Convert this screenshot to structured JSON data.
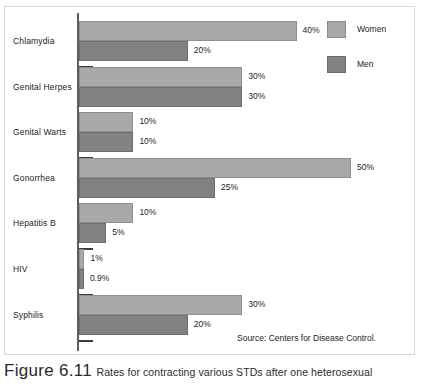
{
  "chart_data": {
    "type": "bar",
    "orientation": "horizontal",
    "title": "",
    "xlabel": "",
    "ylabel": "",
    "xlim": [
      0,
      50
    ],
    "grid": false,
    "legend_position": "top-right",
    "categories": [
      "Chlamydia",
      "Genital Herpes",
      "Genital Warts",
      "Gonorrhea",
      "Hepatitis B",
      "HIV",
      "Syphilis"
    ],
    "series": [
      {
        "name": "Women",
        "color": "#a9a9a9",
        "values": [
          40,
          30,
          10,
          50,
          10,
          1,
          30
        ],
        "labels": [
          "40%",
          "30%",
          "10%",
          "50%",
          "10%",
          "1%",
          "30%"
        ]
      },
      {
        "name": "Men",
        "color": "#828282",
        "values": [
          20,
          30,
          10,
          25,
          5,
          0.9,
          20
        ],
        "labels": [
          "20%",
          "30%",
          "10%",
          "25%",
          "5%",
          "0.9%",
          "20%"
        ]
      }
    ],
    "source": "Source:  Centers for Disease Control."
  },
  "legend": {
    "items": [
      {
        "label": "Women",
        "color": "#a9a9a9"
      },
      {
        "label": "Men",
        "color": "#828282"
      }
    ]
  },
  "caption": {
    "figure_number": "Figure 6.11",
    "text": "Rates for contracting various STDs after one heterosexual"
  }
}
